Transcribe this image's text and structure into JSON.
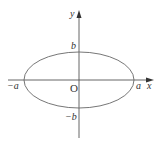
{
  "diagram": {
    "type": "ellipse-on-axes",
    "colors": {
      "stroke": "#555555",
      "text": "#333333",
      "background": "#ffffff"
    },
    "axes": {
      "x_label": "x",
      "y_label": "y",
      "origin_label": "O"
    },
    "ellipse": {
      "right_vertex_label": "a",
      "left_vertex_label": "−a",
      "top_vertex_label": "b",
      "bottom_vertex_label": "−b"
    }
  }
}
